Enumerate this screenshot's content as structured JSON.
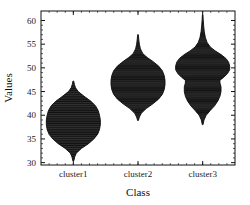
{
  "chart_data": {
    "type": "violin",
    "title": "",
    "xlabel": "Class",
    "ylabel": "Values",
    "categories": [
      "cluster1",
      "cluster2",
      "cluster3"
    ],
    "ylim": [
      29.5,
      62.0
    ],
    "yticks": [
      30,
      35,
      40,
      45,
      50,
      55,
      60
    ],
    "ytick_labels": [
      "30",
      "35",
      "40",
      "45",
      "50",
      "55",
      "60"
    ],
    "grid": false,
    "legend": "none",
    "fill_color": "#3a3a3a",
    "line_color": "#111111",
    "background_color": "#ffffff",
    "series": [
      {
        "name": "cluster1",
        "min": 30.4,
        "max": 47.2,
        "median": 39.0,
        "q1": 36.6,
        "q3": 41.4,
        "peak_value": 39.0,
        "max_width": 1.0,
        "density": [
          {
            "v": 30.4,
            "w": 0.02
          },
          {
            "v": 31.2,
            "w": 0.05
          },
          {
            "v": 32.0,
            "w": 0.11
          },
          {
            "v": 33.0,
            "w": 0.3
          },
          {
            "v": 34.0,
            "w": 0.56
          },
          {
            "v": 35.0,
            "w": 0.76
          },
          {
            "v": 36.0,
            "w": 0.9
          },
          {
            "v": 37.0,
            "w": 0.97
          },
          {
            "v": 38.0,
            "w": 1.0
          },
          {
            "v": 39.0,
            "w": 1.0
          },
          {
            "v": 40.0,
            "w": 0.97
          },
          {
            "v": 41.0,
            "w": 0.92
          },
          {
            "v": 42.0,
            "w": 0.82
          },
          {
            "v": 43.0,
            "w": 0.64
          },
          {
            "v": 44.0,
            "w": 0.4
          },
          {
            "v": 45.0,
            "w": 0.18
          },
          {
            "v": 45.8,
            "w": 0.08
          },
          {
            "v": 46.5,
            "w": 0.04
          },
          {
            "v": 47.2,
            "w": 0.015
          }
        ]
      },
      {
        "name": "cluster2",
        "min": 38.9,
        "max": 57.0,
        "median": 47.4,
        "q1": 45.2,
        "q3": 49.6,
        "peak_value": 47.4,
        "max_width": 1.0,
        "density": [
          {
            "v": 38.9,
            "w": 0.015
          },
          {
            "v": 39.6,
            "w": 0.05
          },
          {
            "v": 40.4,
            "w": 0.12
          },
          {
            "v": 41.4,
            "w": 0.3
          },
          {
            "v": 42.4,
            "w": 0.55
          },
          {
            "v": 43.4,
            "w": 0.76
          },
          {
            "v": 44.4,
            "w": 0.9
          },
          {
            "v": 45.4,
            "w": 0.97
          },
          {
            "v": 46.4,
            "w": 1.0
          },
          {
            "v": 47.4,
            "w": 1.0
          },
          {
            "v": 48.4,
            "w": 0.97
          },
          {
            "v": 49.4,
            "w": 0.9
          },
          {
            "v": 50.4,
            "w": 0.76
          },
          {
            "v": 51.4,
            "w": 0.54
          },
          {
            "v": 52.2,
            "w": 0.34
          },
          {
            "v": 53.0,
            "w": 0.18
          },
          {
            "v": 54.0,
            "w": 0.09
          },
          {
            "v": 55.0,
            "w": 0.05
          },
          {
            "v": 56.0,
            "w": 0.03
          },
          {
            "v": 57.0,
            "w": 0.012
          }
        ]
      },
      {
        "name": "cluster3",
        "min": 38.0,
        "max": 61.2,
        "median": 49.4,
        "q1": 46.4,
        "q3": 51.2,
        "peak_value": 50.2,
        "max_width": 1.0,
        "bimodal": true,
        "density": [
          {
            "v": 38.0,
            "w": 0.012
          },
          {
            "v": 39.0,
            "w": 0.05
          },
          {
            "v": 40.0,
            "w": 0.13
          },
          {
            "v": 41.0,
            "w": 0.28
          },
          {
            "v": 42.0,
            "w": 0.44
          },
          {
            "v": 43.0,
            "w": 0.56
          },
          {
            "v": 44.0,
            "w": 0.64
          },
          {
            "v": 45.0,
            "w": 0.68
          },
          {
            "v": 46.0,
            "w": 0.68
          },
          {
            "v": 46.8,
            "w": 0.64
          },
          {
            "v": 47.4,
            "w": 0.64
          },
          {
            "v": 48.0,
            "w": 0.78
          },
          {
            "v": 48.8,
            "w": 0.92
          },
          {
            "v": 49.6,
            "w": 1.0
          },
          {
            "v": 50.4,
            "w": 1.0
          },
          {
            "v": 51.2,
            "w": 0.96
          },
          {
            "v": 52.0,
            "w": 0.86
          },
          {
            "v": 52.8,
            "w": 0.68
          },
          {
            "v": 53.6,
            "w": 0.46
          },
          {
            "v": 54.4,
            "w": 0.28
          },
          {
            "v": 55.4,
            "w": 0.16
          },
          {
            "v": 56.4,
            "w": 0.1
          },
          {
            "v": 57.6,
            "w": 0.06
          },
          {
            "v": 59.0,
            "w": 0.035
          },
          {
            "v": 60.2,
            "w": 0.02
          },
          {
            "v": 61.2,
            "w": 0.01
          }
        ]
      }
    ]
  }
}
